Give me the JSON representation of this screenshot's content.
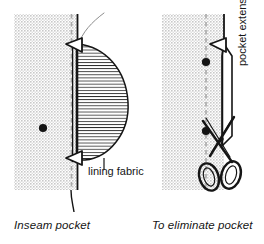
{
  "figure": {
    "type": "technical-sewing-illustration",
    "background_color": "#ffffff",
    "ink_color": "#151515",
    "fabric_fill_color": "#d9d9d9",
    "panels": [
      {
        "id": "left",
        "caption": "Inseam pocket",
        "description": "Garment panel with inseam pocket bag attached at the side seam",
        "elements": {
          "garment_panel": "gray shaded body panel",
          "seam_line": "dashed vertical seamline",
          "pocket_bag": "teardrop shaped hatched pocket bag",
          "notch_top": "triangular notch marker at pocket opening top",
          "notch_bottom": "triangular notch marker at pocket opening bottom",
          "dot_marker": "black circle dot marking",
          "label": "lining fabric"
        },
        "annotations": [
          {
            "text": "lining fabric",
            "leader": "vertical leader line to pocket bag"
          }
        ]
      },
      {
        "id": "right",
        "caption": "To eliminate pocket",
        "description": "Same panel with pocket extension marked and scissors cutting it away",
        "elements": {
          "garment_panel": "gray shaded body panel",
          "seam_line": "dashed vertical seamline",
          "pocket_extension": "narrow extension strip along the seam",
          "notch_top": "triangular notch marker",
          "dot_marker_upper": "black circle dot marking",
          "dot_marker_lower": "black circle dot marking",
          "scissors": "open shears cutting along the extension",
          "label": "pocket extension"
        },
        "annotations": [
          {
            "text": "pocket extension",
            "orientation": "rotated-90-ccw"
          }
        ]
      }
    ]
  },
  "labels": {
    "lining_fabric": "lining fabric",
    "pocket_extension": "pocket extension"
  },
  "captions": {
    "left": "Inseam pocket",
    "right": "To eliminate pocket"
  }
}
